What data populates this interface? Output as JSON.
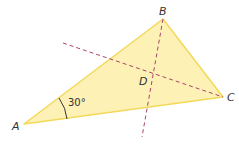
{
  "diagram": {
    "type": "triangle",
    "fill_color": "#fdf1b5",
    "edge_color": "#f2d95a",
    "dash_color": "#a8476a",
    "vertices": {
      "A": {
        "label": "A"
      },
      "B": {
        "label": "B"
      },
      "C": {
        "label": "C"
      }
    },
    "point_D": {
      "label": "D"
    },
    "angle_A": {
      "label": "30°"
    }
  }
}
